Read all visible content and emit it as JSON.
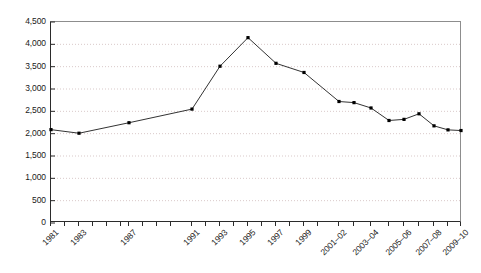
{
  "chart_data": {
    "type": "line",
    "title": "",
    "subtitle": "",
    "xlabel": "",
    "ylabel": "",
    "ylim": [
      0,
      4500
    ],
    "ytick_values": [
      0,
      500,
      1000,
      1500,
      2000,
      2500,
      3000,
      3500,
      4000,
      4500
    ],
    "ytick_labels": [
      "0",
      "500",
      "1,000",
      "1,500",
      "2,000",
      "2,500",
      "3,000",
      "3,500",
      "4,000",
      "4,500"
    ],
    "grid": "horizontal-dotted",
    "legend": "none",
    "marker": "filled-square",
    "line_color": "#333333",
    "marker_color": "#000000",
    "grid_color": "#d9c9c9",
    "axis_color": "#2b2b2b",
    "frame_color": "#8d8d8d",
    "categories": [
      "1981",
      "1982",
      "1983",
      "1984",
      "1985",
      "1986",
      "1987",
      "1988",
      "1989",
      "1990",
      "1991",
      "1992",
      "1993",
      "1994",
      "1995",
      "1996",
      "1997",
      "1998",
      "1999",
      "2000",
      "2001–02",
      "2002–03",
      "2003–04",
      "2004–05",
      "2005–06",
      "2006–07",
      "2007–08",
      "2008–09",
      "2009–10"
    ],
    "xtick_labels_shown": [
      "1981",
      "1983",
      "1987",
      "1991",
      "1993",
      "1995",
      "1997",
      "1999",
      "2001–02",
      "2003–04",
      "2005–06",
      "2007–08",
      "2009–10"
    ],
    "points": [
      {
        "x": "1981",
        "value": 2090
      },
      {
        "x": "1983",
        "value": 2010
      },
      {
        "x": "1987",
        "value": 2245
      },
      {
        "x": "1991",
        "value": 2550
      },
      {
        "x": "1993",
        "value": 3510
      },
      {
        "x": "1995",
        "value": 4150
      },
      {
        "x": "1997",
        "value": 3575
      },
      {
        "x": "1999",
        "value": 3370
      },
      {
        "x": "2001–02",
        "value": 2720
      },
      {
        "x": "2002–03",
        "value": 2695
      },
      {
        "x": "2003–04",
        "value": 2575
      },
      {
        "x": "2004–05",
        "value": 2295
      },
      {
        "x": "2005–06",
        "value": 2320
      },
      {
        "x": "2006–07",
        "value": 2445
      },
      {
        "x": "2007–08",
        "value": 2175
      },
      {
        "x": "2008–09",
        "value": 2085
      },
      {
        "x": "2009–10",
        "value": 2070
      }
    ],
    "point_pixels": [
      {
        "px": 50,
        "value": 2090
      },
      {
        "px": 78,
        "value": 2010
      },
      {
        "px": 128,
        "value": 2245
      },
      {
        "px": 191,
        "value": 2550
      },
      {
        "px": 219,
        "value": 3510
      },
      {
        "px": 247,
        "value": 4150
      },
      {
        "px": 275,
        "value": 3575
      },
      {
        "px": 303,
        "value": 3370
      },
      {
        "px": 338,
        "value": 2720
      },
      {
        "px": 353,
        "value": 2695
      },
      {
        "px": 370,
        "value": 2575
      },
      {
        "px": 388,
        "value": 2295
      },
      {
        "px": 403,
        "value": 2320
      },
      {
        "px": 418,
        "value": 2445
      },
      {
        "px": 433,
        "value": 2175
      },
      {
        "px": 447,
        "value": 2085
      },
      {
        "px": 460,
        "value": 2070
      }
    ],
    "xtick_pixels": [
      50,
      64,
      78,
      92,
      106,
      120,
      128,
      142,
      156,
      170,
      191,
      205,
      219,
      233,
      247,
      261,
      275,
      289,
      303,
      317,
      338,
      353,
      370,
      388,
      403,
      418,
      433,
      447,
      460
    ],
    "xlabel_pixels": [
      {
        "label": "1981",
        "px": 50
      },
      {
        "label": "1983",
        "px": 78
      },
      {
        "label": "1987",
        "px": 128
      },
      {
        "label": "1991",
        "px": 191
      },
      {
        "label": "1993",
        "px": 219
      },
      {
        "label": "1995",
        "px": 247
      },
      {
        "label": "1997",
        "px": 275
      },
      {
        "label": "1999",
        "px": 303
      },
      {
        "label": "2001–02",
        "px": 338
      },
      {
        "label": "2003–04",
        "px": 370
      },
      {
        "label": "2005–06",
        "px": 403
      },
      {
        "label": "2007–08",
        "px": 433
      },
      {
        "label": "2009–10",
        "px": 460
      }
    ]
  }
}
